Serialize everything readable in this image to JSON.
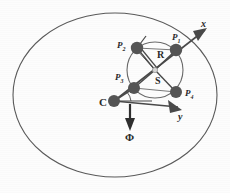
{
  "figure": {
    "type": "geometry-diagram",
    "outer_boundary": {
      "shape": "ellipse",
      "name": "outer-ellipse"
    },
    "inner_circle": {
      "shape": "circle",
      "name": "inner-circle"
    },
    "nodes": [
      {
        "id": "P1",
        "label": "P",
        "subscript": "1",
        "position": "top-right"
      },
      {
        "id": "P2",
        "label": "P",
        "subscript": "2",
        "position": "top-left"
      },
      {
        "id": "P3",
        "label": "P",
        "subscript": "3",
        "position": "bottom-left"
      },
      {
        "id": "P4",
        "label": "P",
        "subscript": "4",
        "position": "bottom-right"
      },
      {
        "id": "C",
        "label": "C",
        "subscript": "",
        "position": "lower-left-center"
      }
    ],
    "measures": [
      {
        "id": "R",
        "label": "R",
        "meaning": "radius of inner circle"
      },
      {
        "id": "S",
        "label": "S",
        "meaning": "distance from center C to circle center"
      }
    ],
    "axes": [
      {
        "id": "x",
        "label": "x",
        "direction": "up-right"
      },
      {
        "id": "y",
        "label": "y",
        "direction": "down-right"
      }
    ],
    "annotations": [
      {
        "id": "phi",
        "label": "Φ",
        "meaning": "phi direction arrow, pointing down"
      }
    ],
    "colors": {
      "node_fill": "#555555",
      "line": "#4a4a4a",
      "outline": "#555555",
      "text": "#2a2a2a",
      "background": "#fdfdfd"
    }
  }
}
